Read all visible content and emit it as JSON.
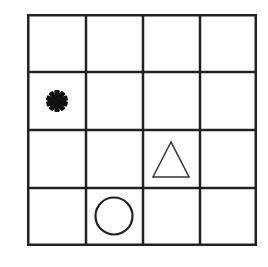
{
  "grid": {
    "rows": 4,
    "cols": 4,
    "line_color": "#222222",
    "background": "#ffffff"
  },
  "symbols": [
    {
      "shape": "asterisk",
      "row": 1,
      "col": 0,
      "fill": "#111111"
    },
    {
      "shape": "triangle",
      "row": 2,
      "col": 2,
      "stroke": "#333333",
      "filled": false
    },
    {
      "shape": "circle",
      "row": 3,
      "col": 1,
      "stroke": "#222222",
      "filled": false
    }
  ]
}
